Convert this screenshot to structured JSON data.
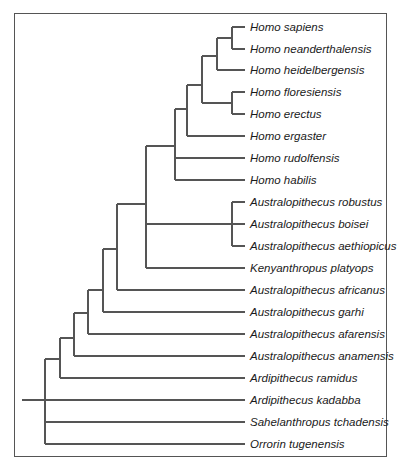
{
  "diagram": {
    "type": "phylogenetic-tree",
    "line_color": "#555555",
    "leaves": [
      {
        "label": "Homo sapiens",
        "y": 27
      },
      {
        "label": "Homo neanderthalensis",
        "y": 49
      },
      {
        "label": "Homo heidelbergensis",
        "y": 70
      },
      {
        "label": "Homo floresiensis",
        "y": 92
      },
      {
        "label": "Homo erectus",
        "y": 114
      },
      {
        "label": "Homo ergaster",
        "y": 136
      },
      {
        "label": "Homo rudolfensis",
        "y": 158
      },
      {
        "label": "Homo habilis",
        "y": 180
      },
      {
        "label": "Australopithecus robustus",
        "y": 202
      },
      {
        "label": "Australopithecus boisei",
        "y": 224
      },
      {
        "label": "Australopithecus aethiopicus",
        "y": 246
      },
      {
        "label": "Kenyanthropus platyops",
        "y": 268
      },
      {
        "label": "Australopithecus africanus",
        "y": 290
      },
      {
        "label": "Australopithecus garhi",
        "y": 312
      },
      {
        "label": "Australopithecus afarensis",
        "y": 334
      },
      {
        "label": "Australopithecus anamensis",
        "y": 356
      },
      {
        "label": "Ardipithecus ramidus",
        "y": 378
      },
      {
        "label": "Ardipithecus kadabba",
        "y": 400
      },
      {
        "label": "Sahelanthropus tchadensis",
        "y": 422
      },
      {
        "label": "Orrorin tugenensis",
        "y": 444
      }
    ]
  }
}
